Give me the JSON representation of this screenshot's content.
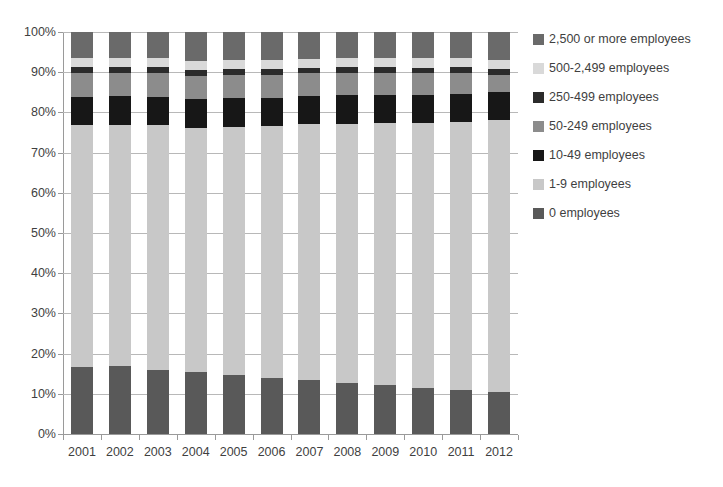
{
  "chart_data": {
    "type": "bar",
    "subtype": "stacked-percentage-column",
    "title": "",
    "subtitle": "",
    "xlabel": "",
    "ylabel": "",
    "ylim": [
      0,
      100
    ],
    "yticks": [
      "0%",
      "10%",
      "20%",
      "30%",
      "40%",
      "50%",
      "60%",
      "70%",
      "80%",
      "90%",
      "100%"
    ],
    "ytick_values": [
      0,
      10,
      20,
      30,
      40,
      50,
      60,
      70,
      80,
      90,
      100
    ],
    "grid": true,
    "legend_position": "right",
    "categories": [
      "2001",
      "2002",
      "2003",
      "2004",
      "2005",
      "2006",
      "2007",
      "2008",
      "2009",
      "2010",
      "2011",
      "2012"
    ],
    "series": [
      {
        "name": "0 employees",
        "color": "#595959",
        "values": [
          16.7,
          17.0,
          15.8,
          15.5,
          14.8,
          14.0,
          13.5,
          12.8,
          12.2,
          11.5,
          10.9,
          10.4
        ]
      },
      {
        "name": "1-9 employees",
        "color": "#c8c8c8",
        "values": [
          60.2,
          59.9,
          61.0,
          60.6,
          61.6,
          62.5,
          63.5,
          64.3,
          65.1,
          65.8,
          66.6,
          67.6
        ]
      },
      {
        "name": "10-49 employees",
        "color": "#171717",
        "values": [
          7.0,
          7.1,
          7.1,
          7.2,
          7.2,
          7.1,
          7.1,
          7.2,
          7.1,
          7.1,
          7.1,
          7.1
        ]
      },
      {
        "name": "50-249 employees",
        "color": "#8c8c8c",
        "values": [
          5.8,
          5.7,
          5.8,
          5.8,
          5.7,
          5.7,
          5.6,
          5.5,
          5.4,
          5.4,
          5.3,
          4.3
        ]
      },
      {
        "name": "250-499 employees",
        "color": "#2b2b2b",
        "values": [
          1.5,
          1.5,
          1.5,
          1.5,
          1.5,
          1.4,
          1.4,
          1.4,
          1.4,
          1.3,
          1.3,
          1.3
        ]
      },
      {
        "name": "500-2,499 employees",
        "color": "#d9d9d9",
        "values": [
          2.3,
          2.3,
          2.3,
          2.3,
          2.3,
          2.3,
          2.3,
          2.3,
          2.3,
          2.4,
          2.4,
          2.4
        ]
      },
      {
        "name": "2,500 or more employees",
        "color": "#6a6a6a",
        "values": [
          6.5,
          6.5,
          6.5,
          7.1,
          6.9,
          7.0,
          6.6,
          6.5,
          6.5,
          6.5,
          6.4,
          6.9
        ]
      }
    ]
  },
  "legend": {
    "items": [
      {
        "label": "2,500 or more employees",
        "color": "#6a6a6a"
      },
      {
        "label": "500-2,499 employees",
        "color": "#d9d9d9"
      },
      {
        "label": "250-499 employees",
        "color": "#2b2b2b"
      },
      {
        "label": "50-249 employees",
        "color": "#8c8c8c"
      },
      {
        "label": "10-49 employees",
        "color": "#171717"
      },
      {
        "label": "1-9 employees",
        "color": "#c8c8c8"
      },
      {
        "label": "0 employees",
        "color": "#595959"
      }
    ]
  }
}
